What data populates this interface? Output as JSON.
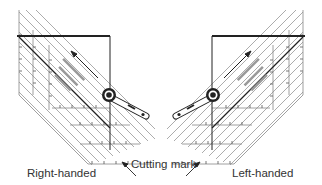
{
  "labels": {
    "right_handed": "Right-handed",
    "left_handed": "Left-handed",
    "cutting_mark": "Cutting mark"
  },
  "icons": {
    "rotary_cutter": "rotary-cutter-icon",
    "ruler": "diagonal-ruler",
    "arrow": "cut-direction-arrow"
  },
  "colors": {
    "line": "#222222",
    "ruler_line": "#888888",
    "text": "#333333",
    "background": "#ffffff"
  }
}
